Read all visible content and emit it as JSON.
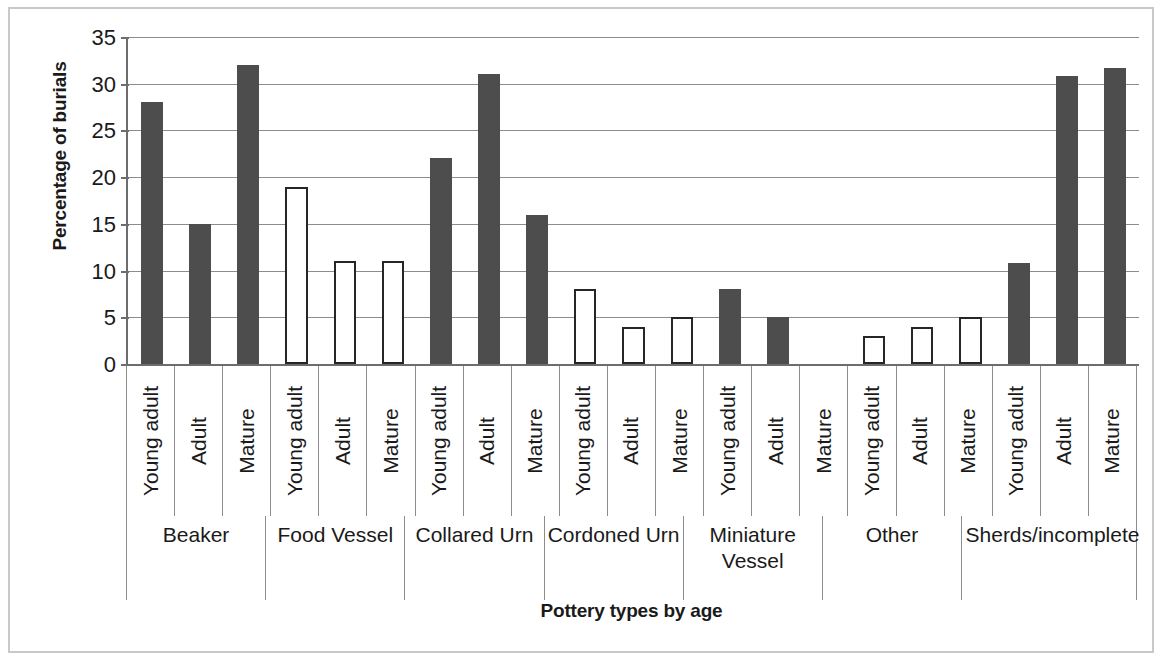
{
  "chart_data": {
    "type": "bar",
    "title": "",
    "xlabel": "Pottery types by age",
    "ylabel": "Percentage of burials",
    "ylim": [
      0,
      35
    ],
    "ytick_labels": [
      "35",
      "30",
      "25",
      "20",
      "15",
      "10",
      "5",
      "0"
    ],
    "ytick_values": [
      35,
      30,
      25,
      20,
      15,
      10,
      5,
      0
    ],
    "grid": true,
    "legend": "none",
    "age_categories": [
      "Young adult",
      "Adult",
      "Mature"
    ],
    "groups": [
      {
        "label": "Beaker",
        "style": "filled",
        "bars": [
          {
            "age": "Young adult",
            "value": 28,
            "style": "filled"
          },
          {
            "age": "Adult",
            "value": 15,
            "style": "filled"
          },
          {
            "age": "Mature",
            "value": 32,
            "style": "filled"
          }
        ]
      },
      {
        "label": "Food Vessel",
        "style": "hollow",
        "bars": [
          {
            "age": "Young adult",
            "value": 19,
            "style": "hollow"
          },
          {
            "age": "Adult",
            "value": 11,
            "style": "hollow"
          },
          {
            "age": "Mature",
            "value": 11,
            "style": "hollow"
          }
        ]
      },
      {
        "label": "Collared Urn",
        "style": "filled",
        "bars": [
          {
            "age": "Young adult",
            "value": 22,
            "style": "filled"
          },
          {
            "age": "Adult",
            "value": 31,
            "style": "filled"
          },
          {
            "age": "Mature",
            "value": 16,
            "style": "filled"
          }
        ]
      },
      {
        "label": "Cordoned Urn",
        "style": "hollow",
        "bars": [
          {
            "age": "Young adult",
            "value": 8,
            "style": "hollow"
          },
          {
            "age": "Adult",
            "value": 4,
            "style": "hollow"
          },
          {
            "age": "Mature",
            "value": 5,
            "style": "hollow"
          }
        ]
      },
      {
        "label": "Miniature Vessel",
        "style": "filled",
        "bars": [
          {
            "age": "Young adult",
            "value": 8,
            "style": "filled"
          },
          {
            "age": "Adult",
            "value": 5,
            "style": "filled"
          },
          {
            "age": "Mature",
            "value": 0,
            "style": "filled"
          }
        ]
      },
      {
        "label": "Other",
        "style": "hollow",
        "bars": [
          {
            "age": "Young adult",
            "value": 3,
            "style": "hollow"
          },
          {
            "age": "Adult",
            "value": 4,
            "style": "hollow"
          },
          {
            "age": "Mature",
            "value": 5,
            "style": "hollow"
          }
        ]
      },
      {
        "label": "Sherds/incomplete",
        "style": "filled",
        "bars": [
          {
            "age": "Young adult",
            "value": 10.8,
            "style": "filled"
          },
          {
            "age": "Adult",
            "value": 30.8,
            "style": "filled"
          },
          {
            "age": "Mature",
            "value": 31.7,
            "style": "filled"
          }
        ]
      }
    ],
    "colors": {
      "bar_filled": "#4d4d4d",
      "bar_hollow_fill": "#ffffff",
      "bar_hollow_stroke": "#262626",
      "gridline": "#8c8c8c",
      "axis": "#6d6d6d",
      "text": "#1a1a1a",
      "frame": "#c9c9c9",
      "background": "#ffffff"
    }
  }
}
